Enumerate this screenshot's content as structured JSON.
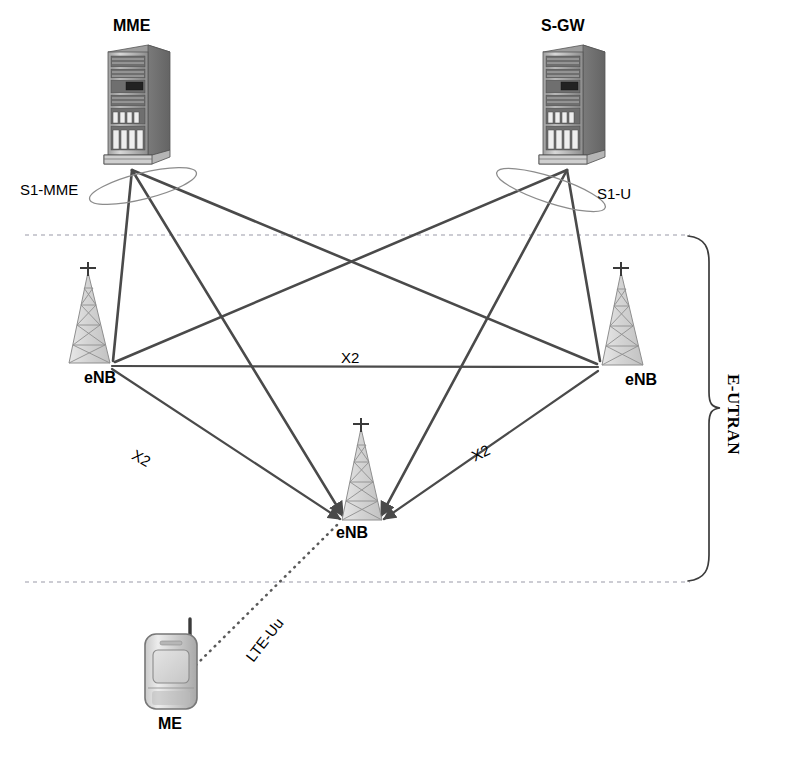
{
  "diagram": {
    "type": "network-topology-diagram",
    "background_color": "#ffffff",
    "line_color": "#4a4a4a",
    "dash_color": "#9a9aa8",
    "text_color": "#000000",
    "width": 797,
    "height": 757
  },
  "nodes": {
    "mme": {
      "label": "MME",
      "icon": "server-rack-icon",
      "x": 132,
      "y": 170,
      "label_x": 113,
      "label_y": 18
    },
    "sgw": {
      "label": "S-GW",
      "icon": "server-rack-icon",
      "x": 567,
      "y": 170,
      "label_x": 541,
      "label_y": 18
    },
    "enb_left": {
      "label": "eNB",
      "icon": "cell-tower-icon",
      "x": 110,
      "y": 365,
      "label_x": 84,
      "label_y": 370
    },
    "enb_right": {
      "label": "eNB",
      "icon": "cell-tower-icon",
      "x": 600,
      "y": 367,
      "label_x": 625,
      "label_y": 372
    },
    "enb_center": {
      "label": "eNB",
      "icon": "cell-tower-icon",
      "x": 361,
      "y": 521,
      "label_x": 336,
      "label_y": 525
    },
    "me": {
      "label": "ME",
      "icon": "mobile-phone-icon",
      "x": 172,
      "y": 670,
      "label_x": 158,
      "label_y": 716
    }
  },
  "interfaces": {
    "s1_mme": {
      "label": "S1-MME",
      "x": 20,
      "y": 182
    },
    "s1_u": {
      "label": "S1-U",
      "x": 597,
      "y": 186
    },
    "lte_uu": {
      "label": "LTE-Uu",
      "x": 252,
      "y": 662,
      "rotation": -52
    },
    "x2_horizontal": {
      "label": "X2",
      "x": 341,
      "y": 350,
      "rotation": 0
    },
    "x2_left": {
      "label": "X2",
      "x": 137,
      "y": 447,
      "rotation": 29
    },
    "x2_right": {
      "label": "X2",
      "x": 469,
      "y": 450,
      "rotation": -26
    }
  },
  "regions": {
    "eutran": {
      "label": "E-UTRAN",
      "x": 742,
      "y": 374,
      "rotation": 90
    }
  },
  "boundaries": {
    "top_dashed": {
      "y": 235,
      "x_start": 25,
      "x_end": 690
    },
    "bottom_dashed": {
      "y": 582,
      "x_start": 25,
      "x_end": 690
    }
  },
  "links": [
    {
      "from": "mme",
      "to": "enb_left",
      "style": "solid",
      "name": "s1-mme-left"
    },
    {
      "from": "mme",
      "to": "enb_right",
      "style": "solid",
      "name": "s1-mme-right"
    },
    {
      "from": "mme",
      "to": "enb_center",
      "style": "solid",
      "name": "s1-mme-center"
    },
    {
      "from": "sgw",
      "to": "enb_left",
      "style": "solid",
      "name": "s1-u-left"
    },
    {
      "from": "sgw",
      "to": "enb_right",
      "style": "solid",
      "name": "s1-u-right"
    },
    {
      "from": "sgw",
      "to": "enb_center",
      "style": "solid",
      "name": "s1-u-center"
    },
    {
      "from": "enb_left",
      "to": "enb_right",
      "style": "solid",
      "name": "x2-horizontal"
    },
    {
      "from": "enb_left",
      "to": "enb_center",
      "style": "solid",
      "name": "x2-left"
    },
    {
      "from": "enb_right",
      "to": "enb_center",
      "style": "solid",
      "name": "x2-right"
    },
    {
      "from": "me",
      "to": "enb_center",
      "style": "dotted",
      "name": "lte-uu-radio"
    }
  ]
}
